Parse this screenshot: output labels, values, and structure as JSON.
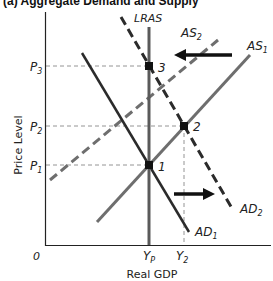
{
  "title": "(a) Aggregate Demand and Supply",
  "axes": {
    "y_label": "Price Level",
    "x_label": "Real GDP",
    "origin": "0"
  },
  "price_levels": [
    {
      "label": "P",
      "sub": "3",
      "y": 66
    },
    {
      "label": "P",
      "sub": "2",
      "y": 126
    },
    {
      "label": "P",
      "sub": "1",
      "y": 165
    }
  ],
  "gdp_levels": [
    {
      "label": "Y",
      "sub": "P",
      "x": 149
    },
    {
      "label": "Y",
      "sub": "2",
      "x": 184
    }
  ],
  "curves": {
    "lras": {
      "label": "LRAS"
    },
    "as1": {
      "label": "AS",
      "sub": "1"
    },
    "as2": {
      "label": "AS",
      "sub": "2"
    },
    "ad1": {
      "label": "AD",
      "sub": "1"
    },
    "ad2": {
      "label": "AD",
      "sub": "2"
    }
  },
  "points": [
    {
      "label": "1",
      "x": 149,
      "y": 165
    },
    {
      "label": "2",
      "x": 184,
      "y": 126
    },
    {
      "label": "3",
      "x": 149,
      "y": 66
    }
  ],
  "colors": {
    "curve_dark": "#2b2b2b",
    "curve_gray": "#6e6e6e",
    "guide": "#7a7a7a"
  }
}
